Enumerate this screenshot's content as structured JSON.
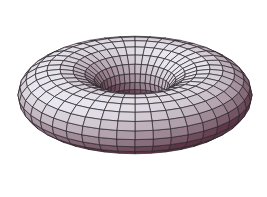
{
  "scene": {
    "subject": "torus",
    "description": "3D shaded torus with wireframe grid mesh",
    "background": "#ffffff",
    "mesh_line_color": "#2a2228",
    "colors": {
      "highlight": "#e8e6ee",
      "light": "#c9c4d6",
      "mid": "#a898a8",
      "shadow": "#7a5566",
      "deep": "#5a3444"
    }
  },
  "torus": {
    "center_x": 135,
    "center_y": 95,
    "major_radius": 75,
    "minor_radius": 42,
    "tilt_degrees": 58,
    "u_segments": 40,
    "v_segments": 20,
    "scale_x": 1.0,
    "scale_y": 1.0
  }
}
